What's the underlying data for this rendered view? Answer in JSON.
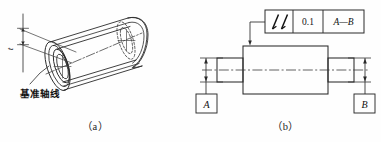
{
  "figure": {
    "background_color": "#fefefe",
    "line_color": "#262626",
    "thin_line_color": "#555555"
  },
  "panel_a": {
    "caption": "（a）",
    "datum_axis_label": "基准轴线",
    "tolerance_label": "t",
    "description": "Isometric tube with cylindrical tolerance zone envelope"
  },
  "panel_b": {
    "caption": "（b）",
    "feature_control_frame": {
      "symbol_name": "total-runout-symbol",
      "tolerance_value": "0.1",
      "datum_reference": "A—B"
    },
    "datum_a": "A",
    "datum_b": "B"
  }
}
